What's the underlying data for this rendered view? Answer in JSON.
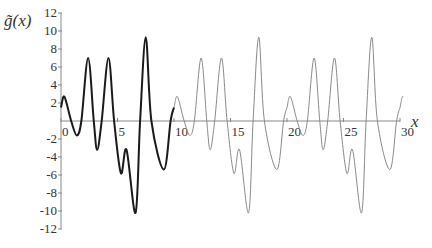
{
  "chart_data": {
    "type": "line",
    "title": "",
    "xlabel": "x",
    "ylabel": "g̃(x)",
    "xlim": [
      0,
      30
    ],
    "ylim": [
      -12,
      12
    ],
    "grid": false,
    "legend": "none",
    "x_ticks": [
      0,
      5,
      10,
      15,
      20,
      25,
      30
    ],
    "y_ticks": [
      -12,
      -10,
      -8,
      -6,
      -4,
      -2,
      2,
      4,
      6,
      8,
      10,
      12
    ],
    "period": 10,
    "one_period_keypoints": {
      "x": [
        0,
        0.3,
        0.9,
        1.4,
        1.8,
        2.4,
        2.9,
        3.2,
        3.6,
        4.2,
        4.7,
        5.3,
        5.8,
        6.6,
        7.0,
        7.5,
        8.0,
        9.1,
        9.7,
        10
      ],
      "y": [
        1.5,
        2.7,
        0,
        -1.6,
        0,
        7.0,
        0,
        -3.2,
        0,
        7.0,
        0,
        -5.8,
        -3.2,
        -10.2,
        0,
        9.3,
        0,
        -5.4,
        0,
        1.5
      ]
    },
    "series": [
      {
        "name": "g̃(x) on [0,10]",
        "x_range": [
          0,
          10
        ],
        "color": "#1a1a1a",
        "stroke_width": 2
      },
      {
        "name": "periodic extension",
        "x_range": [
          10,
          30.3
        ],
        "color": "#8a8a8a",
        "stroke_width": 1
      }
    ]
  },
  "labels": {
    "y_title_g": "g̃",
    "y_title_paren": "(x)",
    "x_title": "x"
  },
  "colors": {
    "axis": "#888888",
    "primary": "#1a1a1a",
    "extension": "#8a8a8a"
  }
}
